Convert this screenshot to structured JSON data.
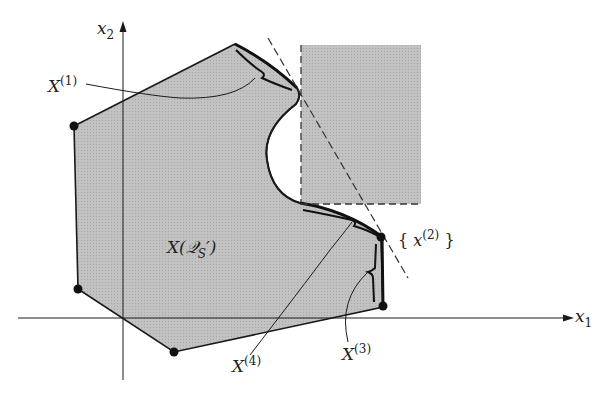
{
  "figure": {
    "axes": {
      "x_label": "x",
      "x_sub": "1",
      "y_label": "x",
      "y_sub": "2"
    },
    "region_label": {
      "main": "X(",
      "script": "𝒬",
      "sub": "S",
      "prime": "′)"
    },
    "labels": {
      "x1": {
        "base": "X",
        "sup": "(1)"
      },
      "x2": {
        "open": "{ ",
        "base": "x",
        "sup": "(2)",
        "close": " }"
      },
      "x3": {
        "base": "X",
        "sup": "(3)"
      },
      "x4": {
        "base": "X",
        "sup": "(4)"
      }
    },
    "colors": {
      "region_fill": "#bdbdbd",
      "line": "#1a1a1a",
      "background": "#ffffff"
    }
  }
}
